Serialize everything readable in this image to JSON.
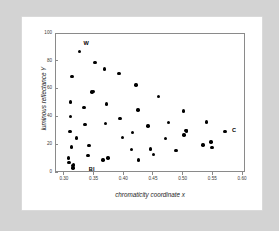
{
  "figure": {
    "background_color": "#d3d3d3",
    "card_color": "#ffffff",
    "marker_color": "#000000",
    "axis_color": "#8a8a8a"
  },
  "chart_data": {
    "type": "scatter",
    "title": "",
    "xlabel": "chromaticity coordinate x",
    "ylabel": "luminous reflectance Y",
    "xlim": [
      0.285,
      0.605
    ],
    "ylim": [
      0,
      100
    ],
    "xticks": [
      "0.30",
      "0.35",
      "0.40",
      "0.45",
      "0.50",
      "0.55",
      "0.60"
    ],
    "xtick_values": [
      0.3,
      0.35,
      0.4,
      0.45,
      0.5,
      0.55,
      0.6
    ],
    "yticks": [
      "0",
      "20",
      "40",
      "60",
      "80",
      "100"
    ],
    "ytick_values": [
      0,
      20,
      40,
      60,
      80,
      100
    ],
    "grid": false,
    "legend": "none",
    "points": [
      {
        "x": 0.3075,
        "y": 10.0
      },
      {
        "x": 0.3085,
        "y": 7.0
      },
      {
        "x": 0.3105,
        "y": 29.0
      },
      {
        "x": 0.311,
        "y": 40.0
      },
      {
        "x": 0.3115,
        "y": 50.5
      },
      {
        "x": 0.3125,
        "y": 18.0
      },
      {
        "x": 0.3135,
        "y": 68.5
      },
      {
        "x": 0.315,
        "y": 4.5
      },
      {
        "x": 0.3155,
        "y": 3.0
      },
      {
        "x": 0.3165,
        "y": 5.5
      },
      {
        "x": 0.3215,
        "y": 24.5
      },
      {
        "x": 0.3265,
        "y": 86.5
      },
      {
        "x": 0.3335,
        "y": 46.5
      },
      {
        "x": 0.3355,
        "y": 34.0
      },
      {
        "x": 0.3405,
        "y": 12.0
      },
      {
        "x": 0.3425,
        "y": 19.0
      },
      {
        "x": 0.3475,
        "y": 57.5
      },
      {
        "x": 0.3495,
        "y": 58.0
      },
      {
        "x": 0.3525,
        "y": 79.0
      },
      {
        "x": 0.3655,
        "y": 8.5
      },
      {
        "x": 0.3685,
        "y": 74.0
      },
      {
        "x": 0.37,
        "y": 35.0
      },
      {
        "x": 0.3715,
        "y": 49.0
      },
      {
        "x": 0.3745,
        "y": 10.0
      },
      {
        "x": 0.3925,
        "y": 71.0
      },
      {
        "x": 0.3945,
        "y": 38.5
      },
      {
        "x": 0.3985,
        "y": 25.0
      },
      {
        "x": 0.4135,
        "y": 16.0
      },
      {
        "x": 0.4155,
        "y": 28.5
      },
      {
        "x": 0.4215,
        "y": 62.5
      },
      {
        "x": 0.4245,
        "y": 44.5
      },
      {
        "x": 0.4255,
        "y": 8.5
      },
      {
        "x": 0.4415,
        "y": 33.0
      },
      {
        "x": 0.4455,
        "y": 16.5
      },
      {
        "x": 0.4505,
        "y": 12.5
      },
      {
        "x": 0.4595,
        "y": 54.5
      },
      {
        "x": 0.4715,
        "y": 24.0
      },
      {
        "x": 0.4765,
        "y": 35.5
      },
      {
        "x": 0.4885,
        "y": 15.5
      },
      {
        "x": 0.5015,
        "y": 44.0
      },
      {
        "x": 0.5025,
        "y": 26.5
      },
      {
        "x": 0.5055,
        "y": 30.0
      },
      {
        "x": 0.5065,
        "y": 29.5
      },
      {
        "x": 0.5345,
        "y": 19.5
      },
      {
        "x": 0.5405,
        "y": 36.0
      },
      {
        "x": 0.5475,
        "y": 21.5
      },
      {
        "x": 0.5495,
        "y": 17.5
      },
      {
        "x": 0.5715,
        "y": 29.0
      }
    ],
    "annotations": [
      {
        "label": "W",
        "x": 0.333,
        "y": 92.0
      },
      {
        "label": "Bl",
        "x": 0.342,
        "y": 1.5
      },
      {
        "label": "C",
        "x": 0.583,
        "y": 29.5
      }
    ]
  }
}
